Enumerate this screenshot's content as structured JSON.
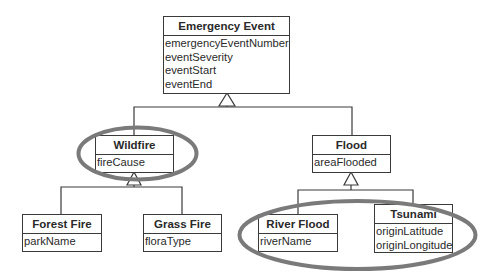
{
  "diagram": {
    "type": "UML class hierarchy",
    "classes": {
      "emergency_event": {
        "name": "Emergency Event",
        "attributes": [
          "emergencyEventNumber",
          "eventSeverity",
          "eventStart",
          "eventEnd"
        ]
      },
      "wildfire": {
        "name": "Wildfire",
        "attributes": [
          "fireCause"
        ]
      },
      "flood": {
        "name": "Flood",
        "attributes": [
          "areaFlooded"
        ]
      },
      "forest_fire": {
        "name": "Forest Fire",
        "attributes": [
          "parkName"
        ]
      },
      "grass_fire": {
        "name": "Grass Fire",
        "attributes": [
          "floraType"
        ]
      },
      "river_flood": {
        "name": "River Flood",
        "attributes": [
          "riverName"
        ]
      },
      "tsunami": {
        "name": "Tsunami",
        "attributes": [
          "originLatitude",
          "originLongitude"
        ]
      }
    },
    "generalizations": [
      {
        "parent": "Emergency Event",
        "children": [
          "Wildfire",
          "Flood"
        ]
      },
      {
        "parent": "Wildfire",
        "children": [
          "Forest Fire",
          "Grass Fire"
        ]
      },
      {
        "parent": "Flood",
        "children": [
          "River Flood",
          "Tsunami"
        ]
      }
    ],
    "highlights": [
      {
        "shape": "ellipse",
        "encloses": [
          "Wildfire"
        ],
        "color": "#7a7a7a"
      },
      {
        "shape": "ellipse",
        "encloses": [
          "River Flood",
          "Tsunami"
        ],
        "color": "#7a7a7a"
      }
    ],
    "colors": {
      "line": "#3a3a3a",
      "highlight": "#7a7a7a",
      "background": "#ffffff"
    }
  }
}
